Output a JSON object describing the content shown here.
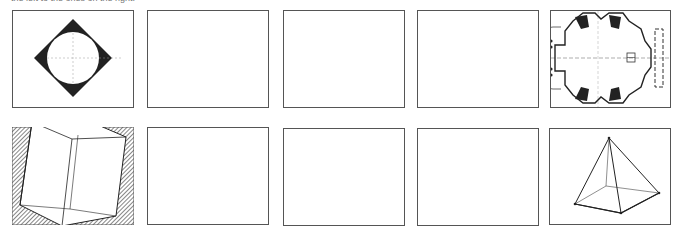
{
  "caption": "the left to the ones on the right.",
  "colors": {
    "ink": "#222222",
    "frame": "#555555",
    "paper": "#ffffff",
    "hatch": "#333333"
  },
  "rows": [
    {
      "frames": [
        {
          "id": "r1c1",
          "content": "square-with-inscribed-circle",
          "filled": true
        },
        {
          "id": "r1c2",
          "content": "empty"
        },
        {
          "id": "r1c3",
          "content": "empty"
        },
        {
          "id": "r1c4",
          "content": "empty"
        },
        {
          "id": "r1c5",
          "content": "architectural-floor-plan"
        }
      ]
    },
    {
      "frames": [
        {
          "id": "r2c1",
          "content": "hatched-cube"
        },
        {
          "id": "r2c2",
          "content": "empty"
        },
        {
          "id": "r2c3",
          "content": "empty"
        },
        {
          "id": "r2c4",
          "content": "empty"
        },
        {
          "id": "r2c5",
          "content": "wireframe-pyramid"
        }
      ]
    }
  ]
}
